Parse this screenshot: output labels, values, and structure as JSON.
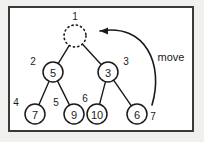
{
  "figure": {
    "background_color": "#f0f0ee",
    "panel_color": "#ffffff",
    "border_color": "#3a3a3a",
    "ink_color": "#1a1a1a"
  },
  "annotation": {
    "move_label": "move"
  },
  "chart_data": {
    "type": "diagram",
    "title": "",
    "nodes": [
      {
        "id": "n1",
        "index": "1",
        "value": "",
        "cx": 75,
        "cy": 36,
        "r": 11,
        "style": "dotted",
        "index_pos": "above",
        "index_x": 75,
        "index_y": 17
      },
      {
        "id": "n2",
        "index": "2",
        "value": "5",
        "cx": 53,
        "cy": 72,
        "r": 10,
        "style": "solid",
        "index_pos": "upper-left",
        "index_x": 33,
        "index_y": 62
      },
      {
        "id": "n3",
        "index": "3",
        "value": "3",
        "cx": 108,
        "cy": 72,
        "r": 10,
        "style": "solid",
        "index_pos": "upper-right",
        "index_x": 126,
        "index_y": 62
      },
      {
        "id": "n4",
        "index": "4",
        "value": "7",
        "cx": 35,
        "cy": 114,
        "r": 10,
        "style": "solid",
        "index_pos": "upper-left",
        "index_x": 16,
        "index_y": 103
      },
      {
        "id": "n5",
        "index": "5",
        "value": "9",
        "cx": 74,
        "cy": 114,
        "r": 10,
        "style": "solid",
        "index_pos": "upper-left",
        "index_x": 56,
        "index_y": 103
      },
      {
        "id": "n6",
        "index": "6",
        "value": "10",
        "cx": 97,
        "cy": 114,
        "r": 10,
        "style": "solid",
        "index_pos": "upper-left",
        "index_x": 85,
        "index_y": 99
      },
      {
        "id": "n7",
        "index": "7",
        "value": "6",
        "cx": 137,
        "cy": 114,
        "r": 10,
        "style": "solid",
        "index_pos": "right",
        "index_x": 153,
        "index_y": 117
      }
    ],
    "edges": [
      {
        "from": "n1",
        "to": "n2"
      },
      {
        "from": "n1",
        "to": "n3"
      },
      {
        "from": "n2",
        "to": "n4"
      },
      {
        "from": "n2",
        "to": "n5"
      },
      {
        "from": "n3",
        "to": "n6"
      },
      {
        "from": "n3",
        "to": "n7"
      }
    ],
    "arrow": {
      "label": "move",
      "label_x": 171,
      "label_y": 57,
      "from_x": 152,
      "from_y": 105,
      "to_x": 100,
      "to_y": 31
    }
  }
}
